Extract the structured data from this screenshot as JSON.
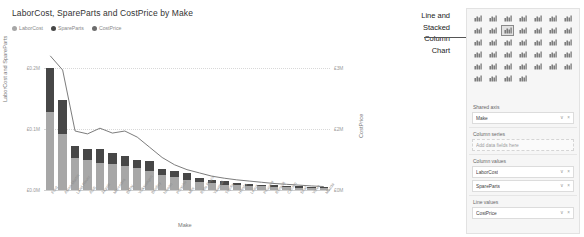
{
  "chart_data": {
    "type": "bar",
    "title": "LaborCost, SpareParts and CostPrice by Make",
    "xlabel": "Make",
    "ylabel": "LaborCost and SpareParts",
    "ylabel_right": "CostPrice",
    "grid": true,
    "legend_position": "top-left",
    "legend": [
      {
        "label": "LaborCost",
        "color": "#a7a7a7"
      },
      {
        "label": "SpareParts",
        "color": "#474747"
      },
      {
        "label": "CostPrice",
        "color": "#6d6d6d"
      }
    ],
    "yticks_left": [
      "£0.2M",
      "£0.1M",
      "£0.0M"
    ],
    "ylim_left": [
      0,
      200000
    ],
    "yticks_right": [
      "£3M",
      "£2M",
      "£0M"
    ],
    "ylim_right": [
      0,
      3000000
    ],
    "categories": [
      "Ford",
      "Aston Martin",
      "Land Rover",
      "Audi",
      "Jaguar",
      "Mercedes",
      "BMW",
      "Volkswagen",
      "Bentley",
      "Nissan",
      "Porsche",
      "Mini",
      "Rolls Royce",
      "Vauxhall",
      "Toyota",
      "Honda",
      "Lexus",
      "Peugeot",
      "Renault",
      "Citroen",
      "Seat",
      "Volvo",
      "Mazda"
    ],
    "series": [
      {
        "name": "LaborCost",
        "color": "#a7a7a7",
        "values": [
          128000,
          92000,
          52000,
          49000,
          45000,
          43000,
          40000,
          36000,
          31000,
          25000,
          22000,
          16000,
          13000,
          11000,
          9000,
          8000,
          7000,
          6000,
          5000,
          4500,
          4000,
          3500,
          3000
        ]
      },
      {
        "name": "SpareParts",
        "color": "#474747",
        "values": [
          72000,
          56000,
          20000,
          19000,
          22000,
          17000,
          15000,
          14000,
          17000,
          10000,
          9000,
          12000,
          7000,
          6000,
          5000,
          4000,
          3500,
          3000,
          2500,
          2000,
          1800,
          1500,
          1200
        ]
      },
      {
        "name": "CostPrice",
        "color": "#6d6d6d",
        "type": "line",
        "axis": "right",
        "values": [
          3300000,
          2950000,
          1450000,
          1380000,
          1520000,
          1400000,
          1450000,
          1300000,
          1050000,
          800000,
          620000,
          500000,
          420000,
          340000,
          290000,
          250000,
          220000,
          190000,
          160000,
          140000,
          120000,
          100000,
          85000
        ]
      }
    ]
  },
  "annotation": {
    "lines": [
      "Line and",
      "Stacked",
      "Column",
      "Chart"
    ]
  },
  "viz_pane": {
    "icons": [
      {
        "name": "stacked-bar-chart-icon",
        "selected": false
      },
      {
        "name": "clustered-bar-chart-icon",
        "selected": false
      },
      {
        "name": "hundred-percent-stacked-bar-chart-icon",
        "selected": false
      },
      {
        "name": "stacked-column-chart-icon",
        "selected": false
      },
      {
        "name": "clustered-column-chart-icon",
        "selected": false
      },
      {
        "name": "hundred-percent-stacked-column-chart-icon",
        "selected": false
      },
      {
        "name": "line-chart-icon",
        "selected": false
      },
      {
        "name": "area-chart-icon",
        "selected": false
      },
      {
        "name": "stacked-area-chart-icon",
        "selected": false
      },
      {
        "name": "line-and-stacked-column-chart-icon",
        "selected": true
      },
      {
        "name": "line-and-clustered-column-chart-icon",
        "selected": false
      },
      {
        "name": "ribbon-chart-icon",
        "selected": false
      },
      {
        "name": "waterfall-chart-icon",
        "selected": false
      },
      {
        "name": "funnel-chart-icon",
        "selected": false
      },
      {
        "name": "scatter-chart-icon",
        "selected": false
      },
      {
        "name": "pie-chart-icon",
        "selected": false
      },
      {
        "name": "donut-chart-icon",
        "selected": false
      },
      {
        "name": "treemap-icon",
        "selected": false
      },
      {
        "name": "map-icon",
        "selected": false
      },
      {
        "name": "filled-map-icon",
        "selected": false
      },
      {
        "name": "shape-map-icon",
        "selected": false
      },
      {
        "name": "arcgis-map-icon",
        "selected": false
      },
      {
        "name": "gauge-icon",
        "selected": false
      },
      {
        "name": "card-icon",
        "selected": false
      },
      {
        "name": "multi-row-card-icon",
        "selected": false
      },
      {
        "name": "kpi-icon",
        "selected": false
      },
      {
        "name": "slicer-icon",
        "selected": false
      },
      {
        "name": "table-icon",
        "selected": false
      },
      {
        "name": "r-script-visual-icon",
        "selected": false
      },
      {
        "name": "python-visual-icon",
        "selected": false
      },
      {
        "name": "key-influencers-icon",
        "selected": false
      },
      {
        "name": "decomposition-tree-icon",
        "selected": false
      },
      {
        "name": "qna-icon",
        "selected": false
      },
      {
        "name": "smart-narrative-icon",
        "selected": false
      },
      {
        "name": "paginated-report-icon",
        "selected": false
      },
      {
        "name": "matrix-icon",
        "selected": false
      },
      {
        "name": "power-apps-icon",
        "selected": false
      },
      {
        "name": "get-more-visuals-icon",
        "selected": false
      },
      {
        "name": "more-options-icon",
        "selected": false
      }
    ],
    "wells": [
      {
        "title": "Shared axis",
        "fields": [
          {
            "name": "Make",
            "empty": false
          }
        ]
      },
      {
        "title": "Column series",
        "fields": [
          {
            "name": "Add data fields here",
            "empty": true
          }
        ]
      },
      {
        "title": "Column values",
        "fields": [
          {
            "name": "LaborCost",
            "empty": false
          },
          {
            "name": "SpareParts",
            "empty": false
          }
        ]
      },
      {
        "title": "Line values",
        "fields": [
          {
            "name": "CostPrice",
            "empty": false
          }
        ]
      }
    ]
  }
}
